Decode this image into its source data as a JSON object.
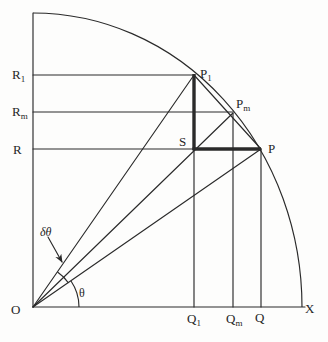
{
  "figure": {
    "colors": {
      "background": "#fdfdfc",
      "ink": "#2a2a2a"
    },
    "canvas": {
      "width": 328,
      "height": 342
    },
    "stroke": {
      "thin": 1.15,
      "thick": 3.4
    },
    "arcs": [
      {
        "name": "quarter-circle-arc",
        "d": "M 33 13 A 269 294 0 0 1 302 307"
      },
      {
        "name": "theta-angle-arc",
        "d": "M 79 307 A 46 46 0 0 0 71 281"
      },
      {
        "name": "delta-theta-angle-arc",
        "d": "M 68.5 283 A 43 43 0 0 0 57.5 272"
      }
    ],
    "thin_lines": [
      {
        "name": "y-axis",
        "x1": 33,
        "y1": 307,
        "x2": 33,
        "y2": 13
      },
      {
        "name": "x-axis",
        "x1": 33,
        "y1": 307,
        "x2": 305,
        "y2": 307
      },
      {
        "name": "line-R1-horizontal",
        "x1": 33,
        "y1": 75,
        "x2": 194,
        "y2": 75
      },
      {
        "name": "line-Rm-horizontal",
        "x1": 33,
        "y1": 112,
        "x2": 233,
        "y2": 112
      },
      {
        "name": "line-R-horizontal",
        "x1": 33,
        "y1": 149,
        "x2": 194,
        "y2": 149
      },
      {
        "name": "line-Q1-vertical",
        "x1": 194,
        "y1": 149,
        "x2": 194,
        "y2": 307
      },
      {
        "name": "line-Qm-vertical",
        "x1": 233,
        "y1": 113,
        "x2": 233,
        "y2": 307
      },
      {
        "name": "line-Q-vertical",
        "x1": 261,
        "y1": 149,
        "x2": 261,
        "y2": 307
      },
      {
        "name": "ray-O-P1",
        "x1": 33,
        "y1": 307,
        "x2": 194,
        "y2": 75
      },
      {
        "name": "ray-O-Pm",
        "x1": 33,
        "y1": 307,
        "x2": 233,
        "y2": 113
      },
      {
        "name": "ray-O-P",
        "x1": 33,
        "y1": 307,
        "x2": 261,
        "y2": 149
      },
      {
        "name": "chord-P1-P",
        "x1": 194,
        "y1": 75,
        "x2": 261,
        "y2": 149
      },
      {
        "name": "delta-theta-arrow",
        "x1": 48,
        "y1": 237,
        "x2": 62,
        "y2": 262,
        "arrow": true
      }
    ],
    "thick_lines": [
      {
        "name": "segment-P1-S",
        "x1": 194,
        "y1": 74,
        "x2": 194,
        "y2": 150
      },
      {
        "name": "segment-S-P",
        "x1": 192.5,
        "y1": 149,
        "x2": 261,
        "y2": 149
      }
    ],
    "labels": [
      {
        "name": "label-O",
        "text": "O",
        "sub": "",
        "x": 11,
        "y": 314,
        "size": 13
      },
      {
        "name": "label-X",
        "text": "X",
        "sub": "",
        "x": 305,
        "y": 313,
        "size": 13
      },
      {
        "name": "label-R1",
        "text": "R",
        "sub": "1",
        "x": 12,
        "y": 79,
        "size": 13
      },
      {
        "name": "label-Rm",
        "text": "R",
        "sub": "m",
        "x": 12,
        "y": 116,
        "size": 13
      },
      {
        "name": "label-R",
        "text": "R",
        "sub": "",
        "x": 13,
        "y": 154,
        "size": 13
      },
      {
        "name": "label-Q1",
        "text": "Q",
        "sub": "1",
        "x": 187,
        "y": 323,
        "size": 13
      },
      {
        "name": "label-Qm",
        "text": "Q",
        "sub": "m",
        "x": 226,
        "y": 323,
        "size": 13
      },
      {
        "name": "label-Q",
        "text": "Q",
        "sub": "",
        "x": 255,
        "y": 322,
        "size": 13
      },
      {
        "name": "label-P1",
        "text": "P",
        "sub": "1",
        "x": 200,
        "y": 78,
        "size": 13
      },
      {
        "name": "label-Pm",
        "text": "P",
        "sub": "m",
        "x": 236,
        "y": 108,
        "size": 13
      },
      {
        "name": "label-P",
        "text": "P",
        "sub": "",
        "x": 268,
        "y": 153,
        "size": 13
      },
      {
        "name": "label-S",
        "text": "S",
        "sub": "",
        "x": 179,
        "y": 146,
        "size": 13
      },
      {
        "name": "label-theta",
        "text": "θ",
        "sub": "",
        "x": 79,
        "y": 297,
        "size": 12
      },
      {
        "name": "label-delta-theta",
        "text": "δθ",
        "sub": "",
        "x": 40,
        "y": 236,
        "size": 12,
        "italic": true
      }
    ]
  }
}
